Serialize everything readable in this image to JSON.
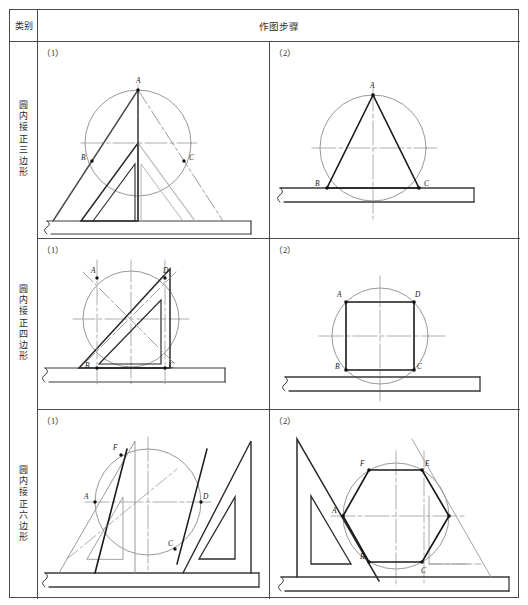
{
  "table": {
    "category_header": "类别",
    "steps_header": "作图步骤",
    "rows": [
      {
        "label": "圆内接正三边形",
        "cells": [
          {
            "step": "（1）",
            "point_labels": [
              "A",
              "B",
              "C"
            ]
          },
          {
            "step": "（2）",
            "point_labels": [
              "A",
              "B",
              "C"
            ]
          }
        ]
      },
      {
        "label": "圆内接正四边形",
        "cells": [
          {
            "step": "（1）",
            "point_labels": [
              "A",
              "D",
              "B",
              "C"
            ]
          },
          {
            "step": "（2）",
            "point_labels": [
              "A",
              "D",
              "B",
              "C"
            ]
          }
        ]
      },
      {
        "label": "圆内接正六边形",
        "cells": [
          {
            "step": "（1）",
            "point_labels": [
              "F",
              "A",
              "D",
              "C"
            ]
          },
          {
            "step": "（2）",
            "point_labels": [
              "F",
              "E",
              "A",
              "B",
              "C"
            ]
          }
        ]
      }
    ]
  },
  "labels": {
    "r1c1": {
      "A": "A",
      "B": "B",
      "C": "C"
    },
    "r1c2": {
      "A": "A",
      "B": "B",
      "C": "C"
    },
    "r2c1": {
      "A": "A",
      "D": "D",
      "B": "B",
      "C": "C"
    },
    "r2c2": {
      "A": "A",
      "D": "D",
      "B": "B",
      "C": "C"
    },
    "r3c1": {
      "F": "F",
      "A": "A",
      "D": "D",
      "C": "C"
    },
    "r3c2": {
      "F": "F",
      "E": "E",
      "A": "A",
      "B": "B",
      "C": "C"
    }
  },
  "colors": {
    "frame": "#4a4a4a",
    "heavy": "#1a1a1a",
    "light": "#8a8a8a",
    "center": "#6e6e6e",
    "text": "#2b2b2b"
  }
}
